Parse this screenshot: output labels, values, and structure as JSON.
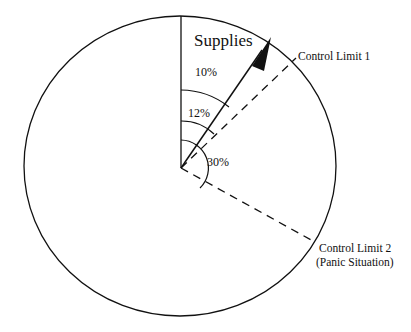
{
  "diagram": {
    "title_label": "Supplies",
    "angles": {
      "a1": "10%",
      "a2": "12%",
      "a3": "30%"
    },
    "limits": {
      "limit1": "Control Limit 1",
      "limit2_line1": "Control Limit 2",
      "limit2_line2": "(Panic Situation)"
    },
    "colors": {
      "stroke": "#111111",
      "background": "#ffffff"
    }
  }
}
